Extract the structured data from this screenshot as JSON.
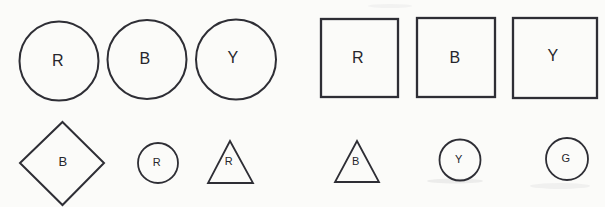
{
  "diagram": {
    "background_color": "#fbfbf9",
    "stroke_color": "#2e2e35",
    "label_color": "#26262c",
    "canvas": {
      "width": 605,
      "height": 207
    },
    "shapes": [
      {
        "name": "large-circle-r",
        "type": "circle",
        "label": "R",
        "cx": 59,
        "cy": 61,
        "r": 39.5,
        "label_x": 58,
        "label_y": 60,
        "font_size": 16,
        "stroke_width": 2
      },
      {
        "name": "large-circle-b",
        "type": "circle",
        "label": "B",
        "cx": 147,
        "cy": 59.5,
        "r": 39.5,
        "label_x": 145,
        "label_y": 58,
        "font_size": 16,
        "stroke_width": 2
      },
      {
        "name": "large-circle-y",
        "type": "circle",
        "label": "Y",
        "cx": 236,
        "cy": 59.5,
        "r": 40,
        "label_x": 233,
        "label_y": 57,
        "font_size": 16,
        "stroke_width": 2
      },
      {
        "name": "large-square-r",
        "type": "rect",
        "label": "R",
        "x": 321,
        "y": 19,
        "w": 77,
        "h": 78,
        "label_x": 358,
        "label_y": 57,
        "font_size": 16,
        "stroke_width": 2.3
      },
      {
        "name": "large-square-b",
        "type": "rect",
        "label": "B",
        "x": 417,
        "y": 18,
        "w": 78,
        "h": 79,
        "label_x": 455,
        "label_y": 57,
        "font_size": 16,
        "stroke_width": 2.3
      },
      {
        "name": "large-square-y",
        "type": "rect",
        "label": "Y",
        "x": 513,
        "y": 18,
        "w": 84,
        "h": 80,
        "label_x": 553,
        "label_y": 55,
        "font_size": 16,
        "stroke_width": 2.3
      },
      {
        "name": "diamond-b",
        "type": "polygon",
        "label": "B",
        "points": "62.5,122 104,163 62.5,205 20,163",
        "label_x": 63,
        "label_y": 161,
        "font_size": 13,
        "stroke_width": 2
      },
      {
        "name": "small-circle-r",
        "type": "circle",
        "label": "R",
        "cx": 158,
        "cy": 163,
        "r": 20,
        "label_x": 157,
        "label_y": 162,
        "font_size": 11,
        "stroke_width": 1.8
      },
      {
        "name": "triangle-r",
        "type": "polygon",
        "label": "R",
        "points": "230,141 253,183 208,183",
        "label_x": 229,
        "label_y": 161,
        "font_size": 11,
        "stroke_width": 1.8
      },
      {
        "name": "triangle-b",
        "type": "polygon",
        "label": "B",
        "points": "357,141 379,182 335,182",
        "label_x": 356,
        "label_y": 161,
        "font_size": 11,
        "stroke_width": 1.8
      },
      {
        "name": "small-circle-y",
        "type": "circle",
        "label": "Y",
        "cx": 460,
        "cy": 160,
        "r": 20.5,
        "label_x": 459,
        "label_y": 159,
        "font_size": 11,
        "stroke_width": 1.8
      },
      {
        "name": "small-circle-g",
        "type": "circle",
        "label": "G",
        "cx": 567,
        "cy": 159,
        "r": 21,
        "label_x": 566,
        "label_y": 158,
        "font_size": 11,
        "stroke_width": 1.8
      }
    ],
    "scan_artifacts": [
      {
        "name": "smudge-bottom-center",
        "cx": 455,
        "cy": 181,
        "rx": 28,
        "ry": 2.5,
        "opacity": 0.1
      },
      {
        "name": "smudge-bottom-right",
        "cx": 560,
        "cy": 186,
        "rx": 30,
        "ry": 3,
        "opacity": 0.07
      },
      {
        "name": "smudge-top-center",
        "cx": 390,
        "cy": 6,
        "rx": 22,
        "ry": 2,
        "opacity": 0.06
      }
    ]
  }
}
